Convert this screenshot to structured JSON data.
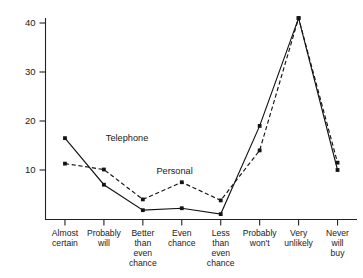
{
  "chart_data": {
    "type": "line",
    "title": "",
    "subtitle": "",
    "xlabel": "",
    "ylabel": "",
    "ylim": [
      0,
      42.5
    ],
    "yticks": [
      10,
      20,
      30,
      40
    ],
    "ytick_labels": [
      "10",
      "20",
      "30",
      "40"
    ],
    "grid": false,
    "legend_position": "inline-annotation",
    "categories": [
      "Almost certain",
      "Probably will",
      "Better than even chance",
      "Even chance",
      "Less than even chance",
      "Probably won't",
      "Very unlikely",
      "Never will buy"
    ],
    "category_lines": [
      [
        "Almost",
        "certain"
      ],
      [
        "Probably",
        "will"
      ],
      [
        "Better",
        "than",
        "even",
        "chance"
      ],
      [
        "Even",
        "chance"
      ],
      [
        "Less",
        "than",
        "even",
        "chance"
      ],
      [
        "Probably",
        "won't"
      ],
      [
        "Very",
        "unlikely"
      ],
      [
        "Never",
        "will",
        "buy"
      ]
    ],
    "series": [
      {
        "name": "Telephone",
        "style": "solid",
        "color": "#141414",
        "values": [
          16.5,
          7.0,
          1.8,
          2.2,
          1.0,
          19.0,
          41.0,
          10.0
        ]
      },
      {
        "name": "Personal",
        "style": "dashed",
        "color": "#141414",
        "values": [
          11.3,
          10.1,
          4.0,
          7.5,
          3.8,
          14.0,
          41.0,
          11.5
        ]
      }
    ],
    "annotations": [
      {
        "text": "Telephone",
        "series": "Telephone",
        "x": 1.05,
        "y": 16.0
      },
      {
        "text": "Personal",
        "series": "Personal",
        "x": 2.35,
        "y": 9.2
      }
    ]
  }
}
